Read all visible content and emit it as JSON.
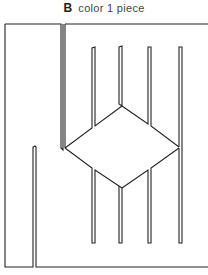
{
  "figure": {
    "label": "B",
    "caption": "color 1 piece"
  },
  "diagram": {
    "stroke_color": "#222222",
    "background": "#ffffff"
  }
}
